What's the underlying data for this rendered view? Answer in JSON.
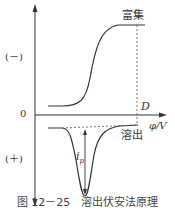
{
  "diagram": {
    "labels": {
      "enrich": "富集",
      "strip": "溶出",
      "negative": "(－)",
      "positive": "(＋)",
      "origin": "0",
      "point_d": "D",
      "x_axis": "φ/V",
      "peak_current": "i",
      "peak_sub": "p"
    },
    "caption": "图 12－25　溶出伏安法原理",
    "colors": {
      "line": "#333333",
      "dash": "#555555"
    }
  }
}
